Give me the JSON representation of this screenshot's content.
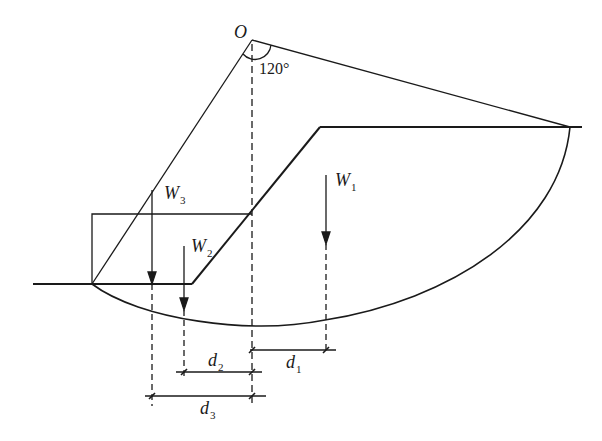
{
  "diagram": {
    "center_label": "O",
    "angle_label": "120°",
    "weights": [
      {
        "symbol": "W",
        "sub": "1"
      },
      {
        "symbol": "W",
        "sub": "2"
      },
      {
        "symbol": "W",
        "sub": "3"
      }
    ],
    "distances": [
      {
        "symbol": "d",
        "sub": "1"
      },
      {
        "symbol": "d",
        "sub": "2"
      },
      {
        "symbol": "d",
        "sub": "3"
      }
    ],
    "colors": {
      "line": "#1a1a1a",
      "background": "#ffffff"
    }
  }
}
